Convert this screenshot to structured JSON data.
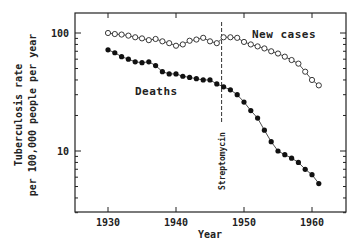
{
  "chart_data": {
    "type": "line",
    "title": "",
    "xlabel": "Year",
    "ylabel": "Tuberculosis rate per 100,000 people per year",
    "ylabel_lines": [
      "Tuberculosis rate",
      "per 100,000 people per year"
    ],
    "yscale": "log",
    "xlim": [
      1925,
      1965
    ],
    "ylim": [
      3,
      150
    ],
    "x_ticks": [
      1930,
      1940,
      1950,
      1960
    ],
    "y_ticks": [
      10,
      100
    ],
    "y_tick_labels": [
      "10",
      "100"
    ],
    "grid": false,
    "legend": "inline labels",
    "x": [
      1930,
      1931,
      1932,
      1933,
      1934,
      1935,
      1936,
      1937,
      1938,
      1939,
      1940,
      1941,
      1942,
      1943,
      1944,
      1945,
      1946,
      1947,
      1948,
      1949,
      1950,
      1951,
      1952,
      1953,
      1954,
      1955,
      1956,
      1957,
      1958,
      1959,
      1960,
      1961
    ],
    "series": [
      {
        "name": "New cases",
        "marker": "open-circle",
        "values": [
          100,
          98,
          97,
          95,
          92,
          90,
          87,
          89,
          85,
          82,
          78,
          80,
          86,
          88,
          91,
          85,
          82,
          92,
          92,
          91,
          84,
          80,
          77,
          74,
          70,
          67,
          63,
          59,
          55,
          47,
          40,
          36
        ]
      },
      {
        "name": "Deaths",
        "marker": "filled-circle",
        "values": [
          72,
          68,
          63,
          60,
          57,
          56,
          57,
          53,
          47,
          45,
          45,
          43,
          42,
          41,
          40,
          40,
          37,
          35,
          33,
          30,
          26,
          22,
          19,
          15,
          12,
          10,
          9.3,
          8.7,
          8.0,
          7.0,
          6.3,
          5.3
        ]
      }
    ],
    "annotations": [
      {
        "text": "New cases",
        "x": 1950,
        "y": 95
      },
      {
        "text": "Deaths",
        "x": 1939,
        "y": 32
      },
      {
        "text": "Streptomycin",
        "x": 1947,
        "type": "vertical dashed line"
      }
    ]
  },
  "caption": "2.11  The decline in tuberculosis ..."
}
